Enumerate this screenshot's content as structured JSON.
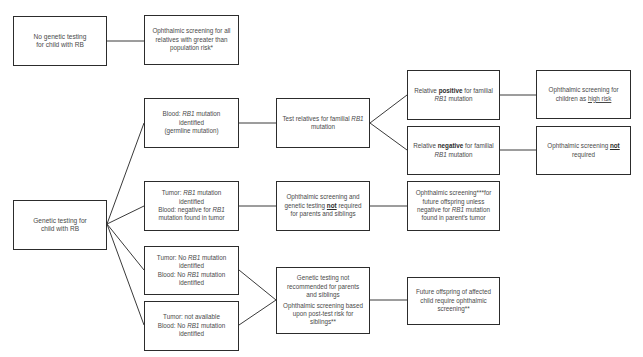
{
  "diagram": {
    "type": "flowchart",
    "nodes": {
      "no_testing": {
        "lines": [
          "No genetic testing",
          "for child with RB"
        ]
      },
      "screen_all_relatives": {
        "lines": [
          "Ophthalmic screening for all",
          "relatives with greater than",
          "population risk*"
        ]
      },
      "genetic_testing": {
        "lines": [
          "Genetic testing for",
          "child with RB"
        ]
      },
      "blood_rb1": {
        "l1_pre": "Blood: ",
        "l1_gene": "RB1",
        "l1_post": " mutation",
        "l2": "identified",
        "l3": "(germline mutation)"
      },
      "tumor_rb1": {
        "l1_pre": "Tumor: ",
        "l1_gene": "RB1",
        "l1_post": " mutation",
        "l2": "identified",
        "l3_pre": "Blood: negative for ",
        "l3_gene": "RB1",
        "l4": "mutation found in tumor"
      },
      "tumor_no_rb1": {
        "l1_pre": "Tumor: No ",
        "l1_gene": "RB1",
        "l1_post": " mutation",
        "l2": "identified",
        "l3_pre": "Blood: No ",
        "l3_gene": "RB1",
        "l3_post": " mutation",
        "l4": "identified"
      },
      "tumor_not_available": {
        "l1": "Tumor: not available",
        "l2_pre": "Blood: No ",
        "l2_gene": "RB1",
        "l2_post": " mutation",
        "l3": "identified"
      },
      "test_relatives": {
        "l1_pre": "Test relatives for familial ",
        "l1_gene": "RB1",
        "l2": "mutation"
      },
      "no_screening_required": {
        "l1": "Ophthalmic screening and",
        "l2_pre": "genetic testing ",
        "l2_bold": "not",
        "l2_post": " required",
        "l3": "for parents and siblings"
      },
      "not_recommended": {
        "l1": "Genetic testing not",
        "l2": "recommended for parents",
        "l3": "and siblings",
        "l4": "Ophthalmic screening based",
        "l5": "upon post-test risk for",
        "l6": "siblings**"
      },
      "relative_positive": {
        "l1_pre": "Relative ",
        "l1_bold": "positive",
        "l1_post": " for familial",
        "l2_gene": "RB1",
        "l2_post": " mutation"
      },
      "relative_negative": {
        "l1_pre": "Relative ",
        "l1_bold": "negative",
        "l1_post": " for familial",
        "l2_gene": "RB1",
        "l2_post": " mutation"
      },
      "offspring_screening_unless": {
        "l1": "Ophthalmic screening***for",
        "l2": "future offspring unless",
        "l3_pre": "negative for ",
        "l3_gene": "RB1",
        "l3_post": " mutation",
        "l4": "found in parent's tumor"
      },
      "offspring_require": {
        "l1": "Future offspring of affected",
        "l2": "child require ophthalmic",
        "l3": "screening**"
      },
      "screen_high_risk": {
        "l1": "Ophthalmic screening for",
        "l2_pre": "children as ",
        "l2_u": "high risk"
      },
      "screen_not_required": {
        "l1_pre": "Ophthalmic screening ",
        "l1_bold": "not",
        "l2": "required"
      }
    },
    "edges": [
      [
        "no_testing",
        "screen_all_relatives"
      ],
      [
        "genetic_testing",
        "blood_rb1"
      ],
      [
        "genetic_testing",
        "tumor_rb1"
      ],
      [
        "genetic_testing",
        "tumor_no_rb1"
      ],
      [
        "genetic_testing",
        "tumor_not_available"
      ],
      [
        "blood_rb1",
        "test_relatives"
      ],
      [
        "test_relatives",
        "relative_positive"
      ],
      [
        "test_relatives",
        "relative_negative"
      ],
      [
        "relative_positive",
        "screen_high_risk"
      ],
      [
        "relative_negative",
        "screen_not_required"
      ],
      [
        "tumor_rb1",
        "no_screening_required"
      ],
      [
        "no_screening_required",
        "offspring_screening_unless"
      ],
      [
        "tumor_no_rb1",
        "not_recommended"
      ],
      [
        "tumor_not_available",
        "not_recommended"
      ],
      [
        "not_recommended",
        "offspring_require"
      ]
    ],
    "colors": {
      "border": "#2c2c2c",
      "text": "#4a4a4a",
      "connector": "#3a3a3a",
      "background": "#ffffff"
    }
  }
}
